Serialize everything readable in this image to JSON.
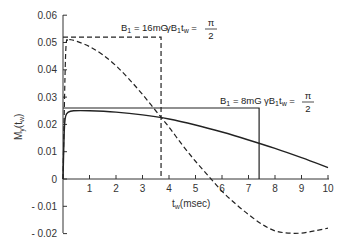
{
  "chart_data": {
    "type": "line",
    "title": "",
    "xlabel": "t_w (msec)",
    "ylabel": "M_y (t_w)",
    "xlim": [
      0,
      10
    ],
    "ylim": [
      -0.02,
      0.06
    ],
    "grid": false,
    "x_ticks": [
      "1",
      "2",
      "3",
      "4",
      "5",
      "6",
      "7",
      "8",
      "9",
      "10"
    ],
    "y_ticks": [
      "0.06",
      "0.05",
      "0.04",
      "0.03",
      "0.02",
      "0.01",
      "0",
      "- 0.01",
      "- 0.02"
    ],
    "series": [
      {
        "name": "B1 = 16mG",
        "style": "dashed",
        "x": [
          0,
          0.1,
          0.2,
          0.3,
          0.5,
          1,
          1.5,
          2,
          2.5,
          3,
          3.5,
          4,
          4.5,
          5,
          5.5,
          6,
          6.5,
          7,
          7.5,
          8,
          8.5,
          9,
          9.5,
          10
        ],
        "y": [
          0,
          0.046,
          0.0505,
          0.051,
          0.0505,
          0.0485,
          0.0455,
          0.0415,
          0.0365,
          0.031,
          0.025,
          0.019,
          0.0125,
          0.0065,
          0.001,
          -0.0045,
          -0.009,
          -0.013,
          -0.0165,
          -0.019,
          -0.0198,
          -0.0198,
          -0.019,
          -0.018
        ]
      },
      {
        "name": "B1 = 8mG",
        "style": "solid",
        "x": [
          0,
          0.05,
          0.1,
          0.2,
          0.4,
          1,
          2,
          3,
          4,
          5,
          6,
          7,
          8,
          9,
          10
        ],
        "y": [
          0,
          0.018,
          0.023,
          0.0245,
          0.025,
          0.025,
          0.0245,
          0.0235,
          0.022,
          0.0198,
          0.0172,
          0.0143,
          0.0112,
          0.0078,
          0.0042
        ]
      }
    ],
    "reference_pulses": [
      {
        "name": "16mG pulse",
        "style": "dashed",
        "height": 0.052,
        "width_msec": 3.7
      },
      {
        "name": "8mG pulse",
        "style": "solid",
        "height": 0.026,
        "width_msec": 7.4
      }
    ],
    "annotations": [
      {
        "text_b": "B",
        "sub_1": "1",
        "text_eq": " = 16mG",
        "gamma": "γB",
        "t": "t",
        "sub_w": "w",
        "eq": " = ",
        "num": "π",
        "den": "2"
      },
      {
        "text_b": "B",
        "sub_1": "1",
        "text_eq": " = 8mG",
        "gamma": "γB",
        "t": "t",
        "sub_w": "w",
        "eq": " = ",
        "num": "π",
        "den": "2"
      }
    ],
    "legend": "none (inline annotations)"
  },
  "axes": {
    "xlabel_main": "t",
    "xlabel_sub": "w",
    "xlabel_rest": "(msec)",
    "ylabel_main": "M",
    "ylabel_sub": "y",
    "ylabel_rest": "(t",
    "ylabel_sub2": "w",
    "ylabel_close": ")"
  }
}
